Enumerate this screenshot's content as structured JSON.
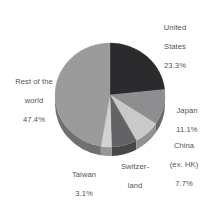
{
  "chart_data": {
    "type": "pie",
    "title": "",
    "subtitle": "",
    "xlabel": "",
    "ylabel": "",
    "legend_position": "none",
    "grid": false,
    "style": "3d-pie",
    "labels_show_percent": true,
    "start_angle_deg": 0,
    "direction": "clockwise",
    "categories": [
      "United States",
      "Japan",
      "China (ex. HK)",
      "Switzerland",
      "Taiwan",
      "Rest of the world"
    ],
    "values": [
      23.3,
      11.1,
      7.7,
      7.5,
      3.1,
      47.4
    ],
    "units": "%",
    "slices": [
      {
        "key": "united_states",
        "name": "United States",
        "name_line1": "United",
        "name_line2": "States",
        "value": 23.3,
        "value_text": "23.3%",
        "color": "#2b2b2d"
      },
      {
        "key": "japan",
        "name": "Japan",
        "name_line1": "Japan",
        "name_line2": "",
        "value": 11.1,
        "value_text": "11.1%",
        "color": "#8e8e90"
      },
      {
        "key": "china_ex_hk",
        "name": "China (ex. HK)",
        "name_line1": "China",
        "name_line2": "(ex. HK)",
        "value": 7.7,
        "value_text": "7.7%",
        "color": "#c9c9c7"
      },
      {
        "key": "switzerland",
        "name": "Switzerland",
        "name_line1": "Switzer-",
        "name_line2": "land",
        "value": 7.5,
        "value_text": "7.5%",
        "color": "#636365"
      },
      {
        "key": "taiwan",
        "name": "Taiwan",
        "name_line1": "Taiwan",
        "name_line2": "",
        "value": 3.1,
        "value_text": "3.1%",
        "color": "#d2d2d0"
      },
      {
        "key": "rest_of_world",
        "name": "Rest of the world",
        "name_line1": "Rest of the",
        "name_line2": "world",
        "value": 47.4,
        "value_text": "47.4%",
        "color": "#9b9b9b"
      }
    ],
    "colors": {
      "background": "#ffffff",
      "label_text": "#555253",
      "united_states": "#2b2b2d",
      "japan": "#8e8e90",
      "china_ex_hk": "#c9c9c7",
      "switzerland": "#636365",
      "taiwan": "#d2d2d0",
      "rest_of_world": "#9b9b9b"
    }
  }
}
